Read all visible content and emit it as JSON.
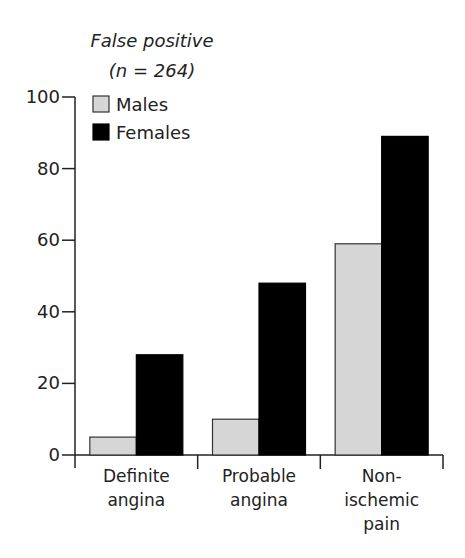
{
  "chart_data": {
    "type": "bar",
    "title": "False positive",
    "subtitle": "(n = 264)",
    "xlabel": "",
    "ylabel": "",
    "ylim": [
      0,
      100
    ],
    "yticks": [
      0,
      20,
      40,
      60,
      80,
      100
    ],
    "grid": false,
    "legend_position": "upper-left-inside",
    "categories": [
      [
        "Definite",
        "angina"
      ],
      [
        "Probable",
        "angina"
      ],
      [
        "Non-",
        "ischemic",
        "pain"
      ]
    ],
    "category_names": [
      "Definite angina",
      "Probable angina",
      "Non-ischemic pain"
    ],
    "series": [
      {
        "name": "Males",
        "color": "#d6d6d6",
        "border": "#333333",
        "values": [
          5,
          10,
          59
        ]
      },
      {
        "name": "Females",
        "color": "#000000",
        "border": "#000000",
        "values": [
          28,
          48,
          89
        ]
      }
    ]
  }
}
